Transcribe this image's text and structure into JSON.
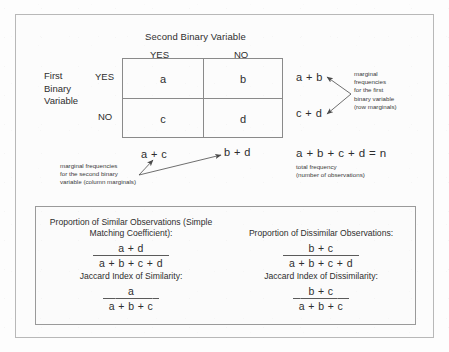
{
  "figure": {
    "column_variable_title": "Second Binary Variable",
    "column_headers": [
      "YES",
      "NO"
    ],
    "row_variable_title_lines": [
      "First",
      "Binary",
      "Variable"
    ],
    "row_headers": [
      "YES",
      "NO"
    ],
    "cells": {
      "a": "a",
      "b": "b",
      "c": "c",
      "d": "d"
    },
    "row_marginals": {
      "yes": "a + b",
      "no": "c + d",
      "note": "marginal\nfrequencies\nfor the first\nbinary variable\n(row marginals)"
    },
    "column_marginals": {
      "yes": "a + c",
      "no": "b + d",
      "note": "marginal frequencies\nfor the second binary\nvariable (column marginals)"
    },
    "total": {
      "expression": "a + b + c + d = n",
      "note": "total frequency\n(number of observations)"
    }
  },
  "formulas": {
    "similar": {
      "title": "Proportion of Similar Observations\n(Simple Matching Coefficient):",
      "numerator": "a + d",
      "denominator": "a + b + c + d"
    },
    "dissimilar": {
      "title": "Proportion of Dissimilar Observations:",
      "numerator": "b + c",
      "denominator": "a + b + c + d"
    },
    "jaccard_similarity": {
      "title": "Jaccard Index of Similarity:",
      "numerator": "a",
      "denominator": "a + b + c"
    },
    "jaccard_dissimilarity": {
      "title": "Jaccard Index of Dissimilarity:",
      "numerator": "b + c",
      "denominator": "a + b + c"
    }
  },
  "colors": {
    "page_background": "#fdfdfd",
    "frame_border": "#b8b8b8",
    "table_border": "#8a8a8a",
    "text": "#2e2e2e"
  }
}
